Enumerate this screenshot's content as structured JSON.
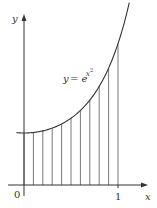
{
  "chart_data": {
    "type": "area",
    "title": "",
    "function": "y = e^(x^2)",
    "xlabel": "x",
    "ylabel": "y",
    "x_ticks": [
      "0",
      "1"
    ],
    "subintervals": 10,
    "x": [
      0,
      0.1,
      0.2,
      0.3,
      0.4,
      0.5,
      0.6,
      0.7,
      0.8,
      0.9,
      1.0
    ],
    "values": [
      1.0,
      1.01,
      1.041,
      1.094,
      1.174,
      1.284,
      1.433,
      1.632,
      1.896,
      2.248,
      2.718
    ],
    "xlim": [
      -0.05,
      1.2
    ],
    "ylim": [
      0,
      3.4
    ]
  },
  "labels": {
    "y_axis": "y",
    "x_axis": "x",
    "origin": "0",
    "one": "1",
    "curve_y": "y",
    "curve_eq": "= e",
    "curve_exp": "x",
    "curve_exp2": "2"
  },
  "colors": {
    "axis": "#333333",
    "curve": "#333333",
    "lines": "#555555"
  }
}
